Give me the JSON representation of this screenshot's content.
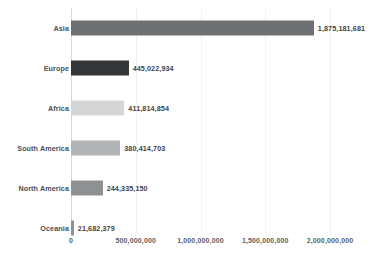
{
  "chart_data": {
    "type": "bar",
    "orientation": "horizontal",
    "title": "",
    "subtitle": "",
    "xlabel": "",
    "ylabel": "",
    "grid": true,
    "legend": "none",
    "xlim": [
      0,
      2000000000
    ],
    "categories": [
      "Asia",
      "Europe",
      "Africa",
      "South America",
      "North America",
      "Oceania"
    ],
    "values": [
      1875181681,
      445022934,
      411814854,
      380414703,
      244335150,
      21682379
    ],
    "value_labels": [
      "1,875,181,681",
      "445,022,934",
      "411,814,854",
      "380,414,703",
      "244,335,150",
      "21,682,379"
    ],
    "bar_colors": [
      "#6e7174",
      "#333639",
      "#d4d6d8",
      "#b1b4b7",
      "#8e9194",
      "#8e9194"
    ],
    "xticks": [
      0,
      500000000,
      1000000000,
      1500000000,
      2000000000
    ],
    "xtick_labels": [
      "0",
      "500,000,000",
      "1,000,000,000",
      "1,500,000,000",
      "2,000,000,000"
    ],
    "axis_color": "#d9d9dc",
    "gridline_color": "#f1f1f2",
    "label_color": "#4b4f56",
    "background": "#ffffff"
  }
}
